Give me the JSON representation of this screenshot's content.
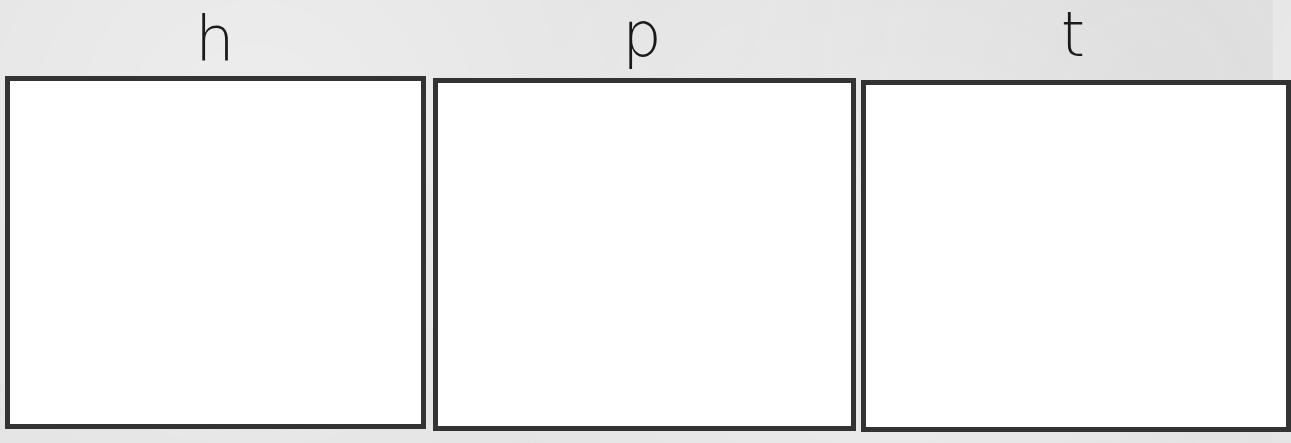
{
  "worksheet": {
    "columns": [
      {
        "letter": "h",
        "answer_box": ""
      },
      {
        "letter": "p",
        "answer_box": ""
      },
      {
        "letter": "t",
        "answer_box": ""
      }
    ]
  },
  "colors": {
    "background": "#e4e4e4",
    "box_border": "#333333",
    "box_fill": "#ffffff",
    "letter": "#1a1a1a"
  }
}
